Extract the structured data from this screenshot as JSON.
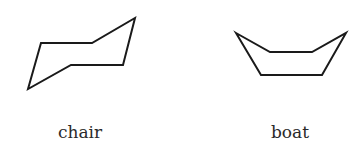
{
  "figure": {
    "chair": {
      "label": "chair",
      "points": "28,89 41,43 92,43 135,18 123,65 71,65"
    },
    "boat": {
      "label": "boat",
      "points": "236,33 270,52 312,52 346,33 322,75 261,75"
    }
  }
}
